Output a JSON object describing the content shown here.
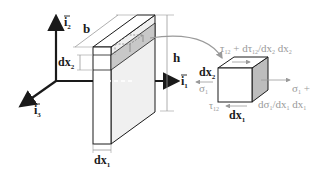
{
  "figure": {
    "axes": {
      "i1": {
        "base": "i",
        "sub": "1"
      },
      "i2": {
        "base": "i",
        "sub": "2"
      },
      "i3": {
        "base": "i",
        "sub": "3"
      }
    },
    "dimensions": {
      "width": "b",
      "height": "h",
      "dx1": {
        "base": "dx",
        "sub": "1"
      },
      "dx2": {
        "base": "dx",
        "sub": "2"
      }
    },
    "element": {
      "dx1": {
        "base": "dx",
        "sub": "1"
      },
      "dx2": {
        "base": "dx",
        "sub": "2"
      }
    },
    "stresses": {
      "sigma1_left": {
        "base": "σ",
        "sub": "1"
      },
      "tau12_bottom": {
        "base": "τ",
        "sub": "12"
      },
      "tau12_top": {
        "pre": "τ",
        "sub1": "12",
        "mid": " + dτ",
        "sub2": "12",
        "mid2": "/dx",
        "sub3": "2",
        "post": " dx",
        "sub4": "2"
      },
      "sigma1_right_line1": {
        "base": "σ",
        "sub": "1",
        "post": " +"
      },
      "sigma1_right_line2": {
        "pre": "dσ",
        "sub1": "1",
        "mid": "/dx",
        "sub2": "1",
        "post": " dx",
        "sub3": "1"
      }
    },
    "colors": {
      "ink": "#1a1a1a",
      "grey_label": "#9a9a9a",
      "face_light": "#f2f2f2",
      "face_shaded": "#c8c8c8",
      "face_side": "#bdbdbd"
    }
  }
}
